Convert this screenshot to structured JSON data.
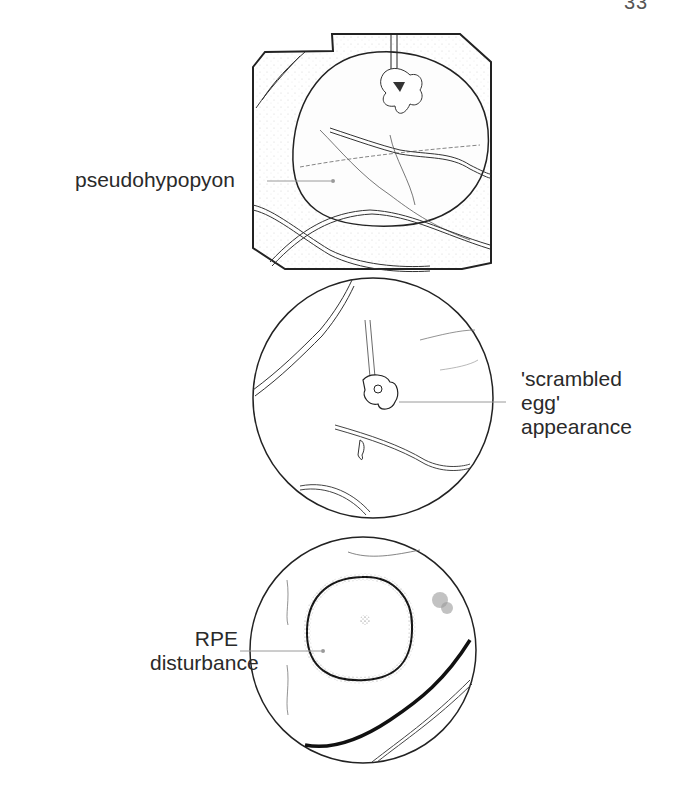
{
  "page": {
    "page_number": "33"
  },
  "figures": [
    {
      "id": "panel-1",
      "shape": "octagonal fundus field",
      "label": "pseudohypopyon"
    },
    {
      "id": "panel-2",
      "shape": "circular fundus field",
      "label_lines": [
        "'scrambled",
        "egg'",
        "appearance"
      ]
    },
    {
      "id": "panel-3",
      "shape": "circular fundus field",
      "label_lines": [
        "RPE",
        "disturbance"
      ]
    }
  ],
  "colors": {
    "ink": "#2a2a2a",
    "leader": "#9a9a9a",
    "stipple": "#bdbdbd"
  }
}
